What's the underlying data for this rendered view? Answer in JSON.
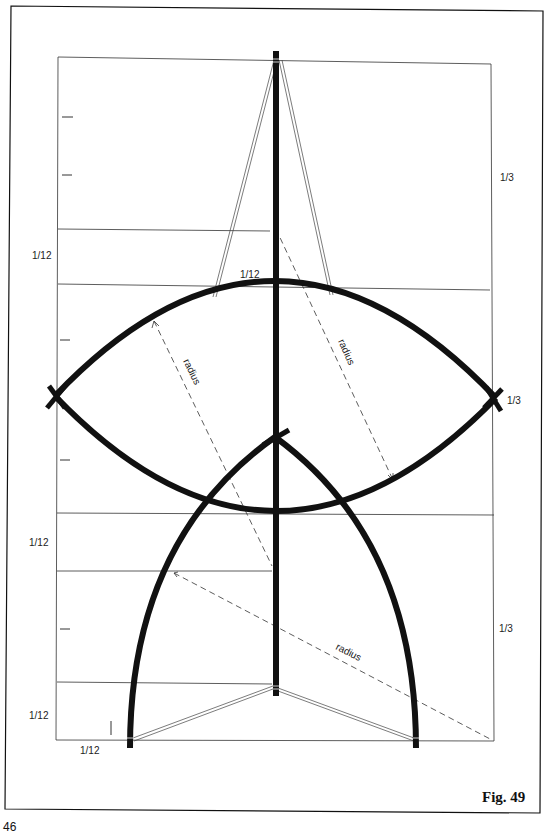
{
  "figure": {
    "caption": "Fig. 49",
    "page_number": "46"
  },
  "labels": {
    "left_1_12_upper": "1/12",
    "left_1_12_middle": "1/12",
    "left_1_12_lower": "1/12",
    "bottom_1_12": "1/12",
    "center_1_12": "1/12",
    "right_1_3_top": "1/3",
    "right_1_3_middle": "1/3",
    "right_1_3_bottom": "1/3",
    "radius_upper_left": "radius",
    "radius_upper_right": "radius",
    "radius_lower": "radius"
  },
  "colors": {
    "ink": "#111111",
    "thin_line": "#333333",
    "paper": "#ffffff"
  }
}
